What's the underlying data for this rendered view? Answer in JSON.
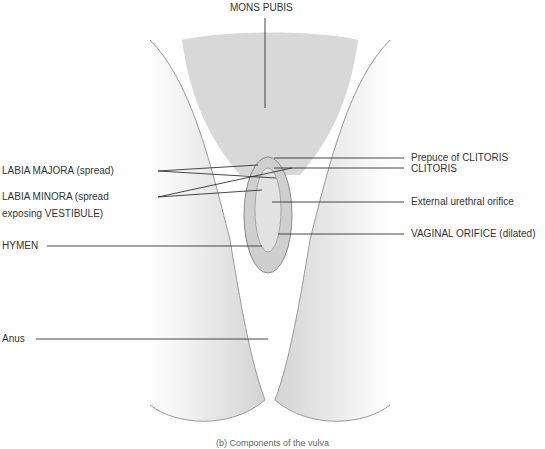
{
  "figure": {
    "caption": "(b) Components of the vulva",
    "caption_note": "caption partially cropped at bottom edge",
    "labels": {
      "mons_pubis": "MONS PUBIS",
      "labia_majora": "LABIA MAJORA (spread)",
      "labia_minora_line1": "LABIA MINORA (spread",
      "labia_minora_line2": "exposing VESTIBULE)",
      "hymen": "HYMEN",
      "anus": "Anus",
      "prepuce_of_clitoris": "Prepuce of CLITORIS",
      "clitoris": "CLITORIS",
      "external_urethral_orifice": "External urethral orifice",
      "vaginal_orifice": "VAGINAL ORIFICE (dilated)"
    },
    "colors": {
      "line": "#333333",
      "skin_shade": "#d9d9d9",
      "hair": "#8a8a8a"
    }
  }
}
